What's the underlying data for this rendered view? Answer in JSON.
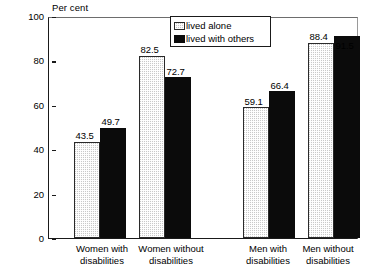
{
  "chart_data": {
    "type": "bar",
    "title": "",
    "subtitle": "",
    "xlabel": "",
    "ylabel": "Per cent",
    "ylim": [
      0,
      100
    ],
    "yticks": [
      0,
      20,
      40,
      60,
      80,
      100
    ],
    "grid": false,
    "legend_position": "top-center-right",
    "categories": [
      "Women with disabilities",
      "Women without disabilities",
      "Men with disabilities",
      "Men without disabilities"
    ],
    "category_lines": [
      [
        "Women with",
        "disabilities"
      ],
      [
        "Women without",
        "disabilities"
      ],
      [
        "Men with",
        "disabilities"
      ],
      [
        "Men without",
        "disabilities"
      ]
    ],
    "series": [
      {
        "name": "lived alone",
        "fill": "stipple-gray",
        "color": "#c9c9c9",
        "values": [
          43.5,
          82.5,
          59.1,
          88.4
        ],
        "labels": [
          "43.5",
          "82.5",
          "59.1",
          "88.4"
        ]
      },
      {
        "name": "lived with others",
        "fill": "solid-black",
        "color": "#0b0b0b",
        "values": [
          49.7,
          72.7,
          66.4,
          91.5
        ],
        "labels": [
          "49.7",
          "72.7",
          "66.4",
          "91.5"
        ]
      }
    ]
  },
  "axis": {
    "unit_label": "Per cent",
    "tick_labels": [
      "100",
      "80",
      "60",
      "40",
      "20",
      "0"
    ]
  },
  "legend": {
    "items": [
      {
        "label": "lived alone",
        "swatch": "stipple-swatch"
      },
      {
        "label": "lived with others",
        "swatch": "solid-black-swatch"
      }
    ]
  }
}
